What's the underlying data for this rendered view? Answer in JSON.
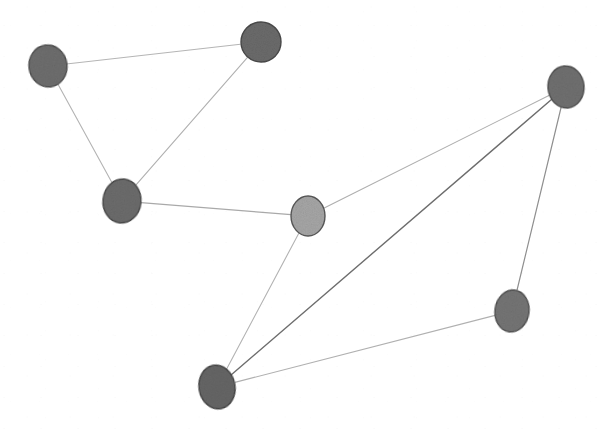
{
  "figure": {
    "kind": "node-link-network-diagram",
    "background_color": "#ffffff",
    "width": 607,
    "height": 432,
    "node_count": 7,
    "edge_count": 9
  },
  "palette": {
    "node_dark_fill": "#6e6e6e",
    "node_dark_stroke": "#4a4a4a",
    "node_light_fill": "#a6a6a6",
    "node_light_stroke": "#585858",
    "edge_light": "#b9b9b9",
    "edge_mid": "#9a9a9a",
    "edge_dark": "#6a6a6a",
    "background": "#ffffff"
  },
  "chart_data": {
    "type": "scatter",
    "title": "",
    "subtitle": "",
    "xlabel": "",
    "ylabel": "",
    "xlim": [
      0,
      607
    ],
    "ylim": [
      0,
      432
    ],
    "grid": false,
    "legend": "none",
    "axes_visible": false,
    "tick_labels": [],
    "annotations": [],
    "nodes": [
      {
        "id": "n1",
        "label": "",
        "x": 48,
        "y": 66,
        "rx": 19,
        "ry": 21,
        "rotation": -8,
        "shade": "dark",
        "fill": "#6e6e6e",
        "stroke": "#4d4d4d",
        "degree": 2
      },
      {
        "id": "n2",
        "label": "",
        "x": 261,
        "y": 42,
        "rx": 20,
        "ry": 20,
        "rotation": 0,
        "shade": "dark",
        "fill": "#6b6b6b",
        "stroke": "#4a4a4a",
        "degree": 2
      },
      {
        "id": "n3",
        "label": "",
        "x": 122,
        "y": 201,
        "rx": 19,
        "ry": 22,
        "rotation": 6,
        "shade": "dark",
        "fill": "#6c6c6c",
        "stroke": "#494949",
        "degree": 3
      },
      {
        "id": "n4",
        "label": "",
        "x": 308,
        "y": 216,
        "rx": 17,
        "ry": 20,
        "rotation": 0,
        "shade": "light",
        "fill": "#a6a6a6",
        "stroke": "#585858",
        "degree": 3
      },
      {
        "id": "n5",
        "label": "",
        "x": 566,
        "y": 87,
        "rx": 18,
        "ry": 21,
        "rotation": -5,
        "shade": "dark",
        "fill": "#707070",
        "stroke": "#4d4d4d",
        "degree": 3
      },
      {
        "id": "n6",
        "label": "",
        "x": 512,
        "y": 311,
        "rx": 17,
        "ry": 21,
        "rotation": 8,
        "shade": "dark",
        "fill": "#757575",
        "stroke": "#4f4f4f",
        "degree": 2
      },
      {
        "id": "n7",
        "label": "",
        "x": 217,
        "y": 387,
        "rx": 18,
        "ry": 22,
        "rotation": -10,
        "shade": "dark",
        "fill": "#666666",
        "stroke": "#454545",
        "degree": 3
      }
    ],
    "edges": [
      {
        "id": "e1",
        "source": "n1",
        "target": "n2",
        "stroke": "#b5b5b5",
        "width": 1.1,
        "weight": "light"
      },
      {
        "id": "e2",
        "source": "n1",
        "target": "n3",
        "stroke": "#b3b3b3",
        "width": 1.1,
        "weight": "light"
      },
      {
        "id": "e3",
        "source": "n2",
        "target": "n3",
        "stroke": "#b0b0b0",
        "width": 1.1,
        "weight": "light"
      },
      {
        "id": "e4",
        "source": "n3",
        "target": "n4",
        "stroke": "#a9a9a9",
        "width": 1.2,
        "weight": "light"
      },
      {
        "id": "e5",
        "source": "n4",
        "target": "n5",
        "stroke": "#aeaeae",
        "width": 1.1,
        "weight": "light"
      },
      {
        "id": "e6",
        "source": "n4",
        "target": "n7",
        "stroke": "#b2b2b2",
        "width": 1.1,
        "weight": "light"
      },
      {
        "id": "e7",
        "source": "n5",
        "target": "n7",
        "stroke": "#6d6d6d",
        "width": 1.4,
        "weight": "dark"
      },
      {
        "id": "e8",
        "source": "n5",
        "target": "n6",
        "stroke": "#8f8f8f",
        "width": 1.2,
        "weight": "mid"
      },
      {
        "id": "e9",
        "source": "n6",
        "target": "n7",
        "stroke": "#b0b0b0",
        "width": 1.1,
        "weight": "light"
      }
    ]
  }
}
